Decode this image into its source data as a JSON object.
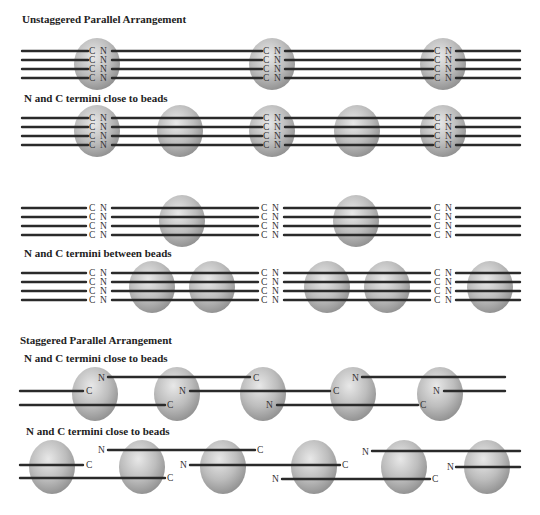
{
  "sections": [
    {
      "id": "unstaggered",
      "title": "Unstaggered Parallel Arrangement"
    },
    {
      "id": "staggered",
      "title": "Staggered Parallel Arrangement"
    }
  ],
  "labels": {
    "row2": "N and C termini close to beads",
    "row4": "N and C termini between beads",
    "row5": "N and C termini close to beads",
    "row6": "N and C termini close to beads"
  },
  "terminus": {
    "n": "N",
    "c": "C"
  },
  "colors": {
    "strand": "#2a2a2a",
    "bead_light": "#e4e4e4",
    "bead_mid": "#b4b4b4",
    "bead_dark": "#8a8a8a",
    "text": "#222222"
  },
  "diagram": {
    "rows": [
      {
        "name": "row1-unstaggered-termini-in-beads",
        "strand_y": [
          51,
          60,
          69,
          78
        ],
        "beads_x": [
          97,
          272,
          443
        ],
        "bead_cy": 63,
        "termini_x": [
          97,
          272,
          443
        ]
      },
      {
        "name": "row2-termini-close-to-beads",
        "strand_y": [
          118,
          127,
          136,
          145
        ],
        "beads_x": [
          97,
          180,
          272,
          357,
          443
        ],
        "bead_cy": 131,
        "termini_x": [
          97,
          272,
          443
        ]
      },
      {
        "name": "row3-termini-between-beads-single",
        "strand_y": [
          208,
          217,
          226,
          235
        ],
        "beads_x": [
          180,
          355
        ],
        "bead_cy": 221,
        "termini_x": [
          97,
          270,
          442
        ]
      },
      {
        "name": "row4-termini-between-beads-double",
        "strand_y": [
          273,
          282,
          291,
          300
        ],
        "beads_x": [
          150,
          210,
          325,
          385,
          490
        ],
        "bead_cy": 287,
        "termini_x": [
          97,
          270,
          442
        ]
      },
      {
        "name": "row5-staggered-close",
        "strand_y": [
          377,
          391,
          405
        ],
        "beads_x": [
          95,
          180,
          263,
          357,
          443
        ],
        "bead_cy": 393
      },
      {
        "name": "row6-staggered-spaced",
        "strand_y": [
          450,
          465,
          478
        ],
        "beads_x": [
          50,
          140,
          225,
          315,
          405,
          490
        ],
        "bead_cy": 468
      }
    ]
  }
}
